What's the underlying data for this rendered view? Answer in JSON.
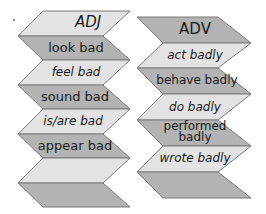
{
  "colors": {
    "light_band": "#e3e3e3",
    "dark_band": "#b3b3b3",
    "edge": "#7a7a7a",
    "text": "#1a1a1a"
  },
  "columns": [
    {
      "title": "ADJ",
      "items": [
        {
          "label": "ADJ",
          "shade": "light",
          "italic": true,
          "is_header": true
        },
        {
          "label": "look bad",
          "shade": "dark",
          "italic": false
        },
        {
          "label": "feel bad",
          "shade": "light",
          "italic": true
        },
        {
          "label": "sound bad",
          "shade": "dark",
          "italic": false
        },
        {
          "label": "is/are bad",
          "shade": "light",
          "italic": true
        },
        {
          "label": "appear bad",
          "shade": "dark",
          "italic": false
        },
        {
          "label": "",
          "shade": "light",
          "italic": false
        },
        {
          "label": "",
          "shade": "dark",
          "italic": false
        }
      ]
    },
    {
      "title": "ADV",
      "items": [
        {
          "label": "ADV",
          "shade": "dark",
          "italic": false,
          "is_header": true
        },
        {
          "label": "act badly",
          "shade": "light",
          "italic": true
        },
        {
          "label": "behave badly",
          "shade": "dark",
          "italic": false
        },
        {
          "label": "do badly",
          "shade": "light",
          "italic": true
        },
        {
          "label": "performed badly",
          "shade": "dark",
          "italic": false
        },
        {
          "label": "wrote badly",
          "shade": "light",
          "italic": true
        },
        {
          "label": "",
          "shade": "dark",
          "italic": false
        }
      ]
    }
  ]
}
